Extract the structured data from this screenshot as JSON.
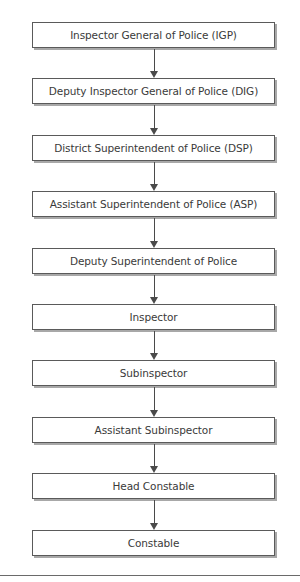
{
  "diagram": {
    "type": "hierarchy-flowchart",
    "direction": "top-to-bottom",
    "nodes": [
      {
        "label": "Inspector General of Police (IGP)"
      },
      {
        "label": "Deputy Inspector General of Police (DIG)"
      },
      {
        "label": "District Superintendent of Police (DSP)"
      },
      {
        "label": "Assistant Superintendent of Police (ASP)"
      },
      {
        "label": "Deputy Superintendent of Police"
      },
      {
        "label": "Inspector"
      },
      {
        "label": "Subinspector"
      },
      {
        "label": "Assistant Subinspector"
      },
      {
        "label": "Head Constable"
      },
      {
        "label": "Constable"
      }
    ],
    "edges": [
      {
        "from": 0,
        "to": 1
      },
      {
        "from": 1,
        "to": 2
      },
      {
        "from": 2,
        "to": 3
      },
      {
        "from": 3,
        "to": 4
      },
      {
        "from": 4,
        "to": 5
      },
      {
        "from": 5,
        "to": 6
      },
      {
        "from": 6,
        "to": 7
      },
      {
        "from": 7,
        "to": 8
      },
      {
        "from": 8,
        "to": 9
      }
    ],
    "colors": {
      "border": "#5a5a5a",
      "shadow": "#a8a8a8",
      "text": "#3a3a3a",
      "arrow": "#4a4a4a",
      "background": "#ffffff"
    }
  }
}
